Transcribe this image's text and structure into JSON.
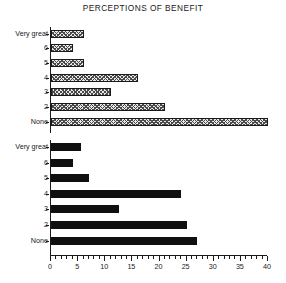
{
  "chart_data": {
    "type": "bar",
    "title": "PERCEPTIONS OF BENEFIT",
    "orientation": "horizontal",
    "xlabel": "",
    "ylabel": "",
    "xlim": [
      0,
      40
    ],
    "xticks": [
      0,
      5,
      10,
      15,
      20,
      25,
      30,
      35,
      40
    ],
    "xtick_labels": [
      "0",
      "5",
      "10",
      "15",
      "20",
      "25",
      "30",
      "35",
      "40"
    ],
    "minor_tick_step": 1,
    "grid": false,
    "legend": null,
    "categories": [
      "Very great",
      "6",
      "5",
      "4",
      "3",
      "2",
      "None"
    ],
    "panels": [
      {
        "name": "upper-panel",
        "fill_style": "crosshatch",
        "categories": [
          "Very great",
          "6",
          "5",
          "4",
          "3",
          "2",
          "None"
        ],
        "values": [
          6,
          4,
          6,
          16,
          11,
          21,
          40
        ]
      },
      {
        "name": "lower-panel",
        "fill_style": "solid",
        "categories": [
          "Very great",
          "6",
          "5",
          "4",
          "3",
          "2",
          "None"
        ],
        "values": [
          5.5,
          4,
          7,
          24,
          12.5,
          25,
          27
        ]
      }
    ]
  },
  "colors": {
    "axis": "#1a1a1a",
    "hatch_line": "#4a4a4a",
    "hatch_fill": "#e8e8e8",
    "solid_bar": "#101010",
    "background": "#ffffff",
    "text": "#1a1a1a"
  }
}
